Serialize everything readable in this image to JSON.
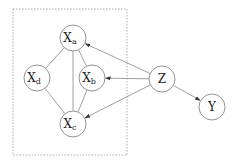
{
  "diagram": {
    "type": "graphical-model",
    "plate": {
      "style": "dashed",
      "x": 13,
      "y": 9,
      "width": 114,
      "height": 146
    },
    "nodes": [
      {
        "id": "Xa",
        "base": "X",
        "sub": "a",
        "cx": 73,
        "cy": 38
      },
      {
        "id": "Xd",
        "base": "X",
        "sub": "d",
        "cx": 37,
        "cy": 78
      },
      {
        "id": "Xb",
        "base": "X",
        "sub": "b",
        "cx": 92,
        "cy": 78
      },
      {
        "id": "Xc",
        "base": "X",
        "sub": "c",
        "cx": 73,
        "cy": 124
      },
      {
        "id": "Z",
        "base": "Z",
        "sub": "",
        "cx": 162,
        "cy": 79
      },
      {
        "id": "Y",
        "base": "Y",
        "sub": "",
        "cx": 212,
        "cy": 107
      }
    ],
    "undirected_edges": [
      [
        "Xa",
        "Xd"
      ],
      [
        "Xa",
        "Xb"
      ],
      [
        "Xa",
        "Xc"
      ],
      [
        "Xd",
        "Xc"
      ],
      [
        "Xb",
        "Xc"
      ]
    ],
    "directed_edges": [
      [
        "Z",
        "Xa"
      ],
      [
        "Z",
        "Xb"
      ],
      [
        "Z",
        "Xc"
      ],
      [
        "Z",
        "Y"
      ]
    ]
  }
}
